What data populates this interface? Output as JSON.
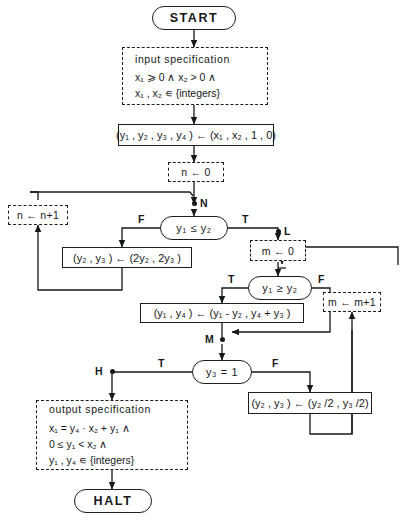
{
  "diagram": {
    "colors": {
      "ink": "#16181a",
      "background": "#ffffff"
    }
  },
  "nodes": {
    "start": {
      "label": "START",
      "type": "terminal"
    },
    "input_spec": {
      "type": "assertion",
      "title": "input specification",
      "line1": "x₁ ⩾ 0  ∧  x₂ > 0  ∧",
      "line2": "x₁ , x₂  ∊ {integers}"
    },
    "init_assign": {
      "type": "process",
      "label": "(y₁ , y₂ , y₃ , y₄ ) ← (x₁ , x₂ , 1 , 0)"
    },
    "n_init": {
      "type": "assertion",
      "label": "n ← 0"
    },
    "n_incr": {
      "type": "assertion",
      "label": "n ← n+1"
    },
    "decision_le": {
      "type": "decision",
      "label": "y₁ ≤  y₂"
    },
    "double": {
      "type": "process",
      "label": "(y₂ , y₃ ) ← (2y₂ , 2y₃ )"
    },
    "m_init": {
      "type": "assertion",
      "label": "m ← 0"
    },
    "m_incr": {
      "type": "assertion",
      "label": "m ← m+1"
    },
    "decision_ge": {
      "type": "decision",
      "label": "y₁ ≥  y₂"
    },
    "subtract": {
      "type": "process",
      "label": "(y₁ , y₄ ) ← (y₁ - y₂ , y₄ + y₃ )"
    },
    "decision_y3": {
      "type": "decision",
      "label": "y₃ = 1"
    },
    "halve": {
      "type": "process",
      "label": "(y₂ , y₃ ) ← (y₂ /2 , y₃ /2)"
    },
    "output_spec": {
      "type": "assertion",
      "title": "output specification",
      "line1": "x₁ = y₄ · x₂ + y₁   ∧",
      "line2": "0 ≤ y₁ < x₂   ∧",
      "line3": "y₁ , y₄  ∊ {integers}"
    },
    "halt": {
      "label": "HALT",
      "type": "terminal"
    }
  },
  "edge_labels": {
    "cutpoint_n": "N",
    "cutpoint_l": "L",
    "cutpoint_m": "M",
    "cutpoint_h": "H",
    "le_false": "F",
    "le_true": "T",
    "ge_true": "T",
    "ge_false": "F",
    "y3_true": "T",
    "y3_false": "F"
  }
}
